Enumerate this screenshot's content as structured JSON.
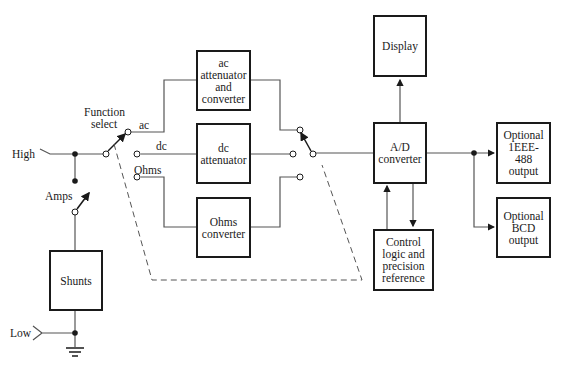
{
  "diagram": {
    "blocks": {
      "ac": {
        "lines": [
          "ac",
          "attenuator",
          "and",
          "converter"
        ]
      },
      "dc": {
        "lines": [
          "dc",
          "attenuator"
        ]
      },
      "ohms": {
        "lines": [
          "Ohms",
          "converter"
        ]
      },
      "display": {
        "lines": [
          "Display"
        ]
      },
      "adc": {
        "lines": [
          "A/D",
          "converter"
        ]
      },
      "control": {
        "lines": [
          "Control",
          "logic and",
          "precision",
          "reference"
        ]
      },
      "ieee": {
        "lines": [
          "Optional",
          "1EEE-",
          "488",
          "output"
        ]
      },
      "bcd": {
        "lines": [
          "Optional",
          "BCD",
          "output"
        ]
      },
      "shunts": {
        "lines": [
          "Shunts"
        ]
      }
    },
    "labels": {
      "high": "High",
      "low": "Low",
      "amps": "Amps",
      "function_select_1": "Function",
      "function_select_2": "select",
      "ac": "ac",
      "dc": "dc",
      "ohms": "Ohms"
    },
    "colors": {
      "line": "#1a1a1a",
      "wire": "#555555",
      "background": "#ffffff"
    }
  }
}
